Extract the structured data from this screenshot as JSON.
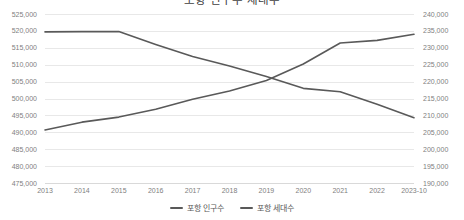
{
  "chart": {
    "title": "포항 인구수 세대수"
  },
  "legend": {
    "position": "bottom",
    "items": [
      {
        "label": "포항 인구수",
        "color": "#595959"
      },
      {
        "label": "포항 세대수",
        "color": "#595959"
      }
    ]
  },
  "chart_data": {
    "type": "line",
    "title": "포항 인구수 세대수",
    "xlabel": "",
    "ylabel": "",
    "grid": true,
    "legend_position": "bottom",
    "categories": [
      "2013",
      "2014",
      "2015",
      "2016",
      "2017",
      "2018",
      "2019",
      "2020",
      "2021",
      "2022",
      "2023-10"
    ],
    "axes": {
      "left": {
        "label": "",
        "ylim": [
          475000,
          525000
        ],
        "ticks": [
          "475,000",
          "480,000",
          "485,000",
          "490,000",
          "495,000",
          "500,000",
          "505,000",
          "510,000",
          "515,000",
          "520,000",
          "525,000"
        ],
        "tick_values": [
          475000,
          480000,
          485000,
          490000,
          495000,
          500000,
          505000,
          510000,
          515000,
          520000,
          525000
        ]
      },
      "right": {
        "label": "",
        "ylim": [
          190000,
          240000
        ],
        "ticks": [
          "190,000",
          "195,000",
          "200,000",
          "205,000",
          "210,000",
          "215,000",
          "220,000",
          "225,000",
          "230,000",
          "235,000",
          "240,000"
        ],
        "tick_values": [
          190000,
          195000,
          200000,
          205000,
          210000,
          215000,
          220000,
          225000,
          230000,
          235000,
          240000
        ]
      }
    },
    "series": [
      {
        "name": "포항 인구수",
        "axis": "left",
        "color": "#595959",
        "values": [
          519700,
          519800,
          519800,
          516000,
          512400,
          509600,
          506500,
          503000,
          502000,
          498300,
          494300
        ]
      },
      {
        "name": "포항 세대수",
        "axis": "right",
        "color": "#595959",
        "values": [
          205700,
          208000,
          209500,
          211800,
          214800,
          217200,
          220300,
          225200,
          231400,
          232200,
          234000
        ]
      }
    ]
  }
}
